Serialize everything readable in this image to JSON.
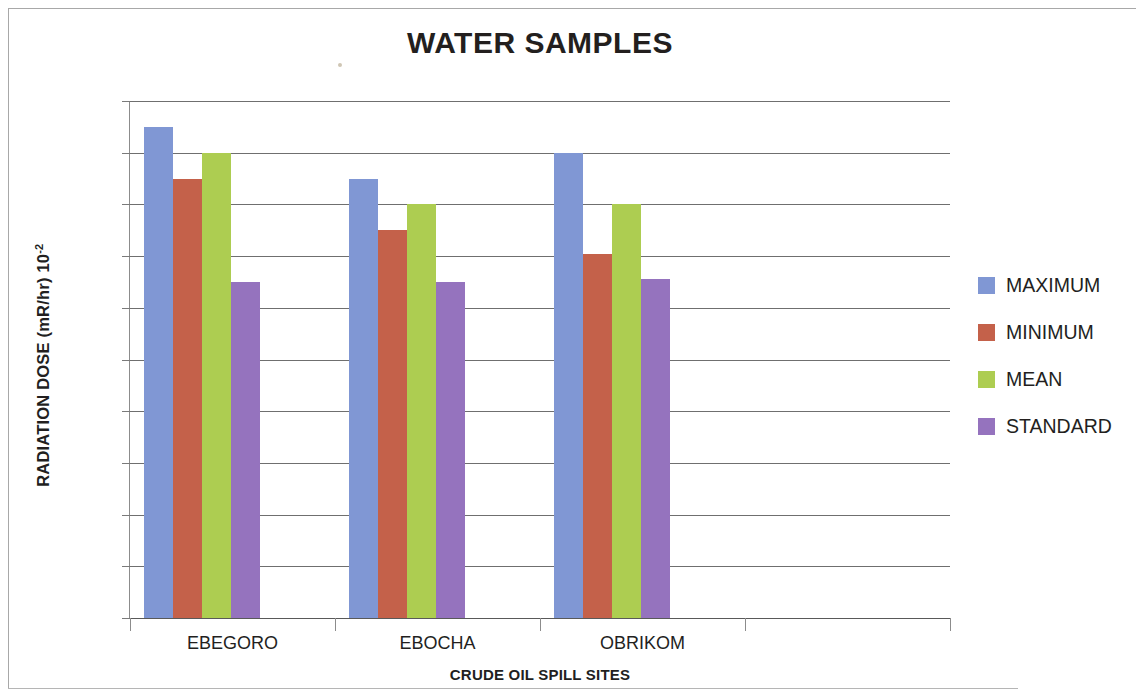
{
  "chart_data": {
    "type": "bar",
    "title": "WATER SAMPLES",
    "xlabel": "CRUDE OIL SPILL SITES",
    "ylabel": "RADIATION DOSE (mR/hr) 10",
    "ylabel_exponent": "-2",
    "categories": [
      "EBEGORO",
      "EBOCHA",
      "OBRIKOM",
      ""
    ],
    "series": [
      {
        "name": "MAXIMUM",
        "color": "#8097D4",
        "values": [
          19.0,
          17.0,
          18.0,
          null
        ]
      },
      {
        "name": "MINIMUM",
        "color": "#C4614A",
        "values": [
          17.0,
          15.0,
          14.1,
          null
        ]
      },
      {
        "name": "MEAN",
        "color": "#ADCD51",
        "values": [
          18.0,
          16.0,
          16.0,
          null
        ]
      },
      {
        "name": "STANDARD",
        "color": "#9573BE",
        "values": [
          13.0,
          13.0,
          13.1,
          null
        ]
      }
    ],
    "ylim": [
      0,
      20
    ],
    "ytick_step": 2,
    "yticks": [
      "20",
      "18",
      "16",
      "14",
      "12",
      "10",
      "8",
      "6",
      "4",
      "2",
      "0"
    ],
    "grid": "horizontal",
    "legend_position": "right",
    "legend_entries": [
      "MAXIMUM",
      "MINIMUM",
      "MEAN",
      "STANDARD"
    ]
  }
}
